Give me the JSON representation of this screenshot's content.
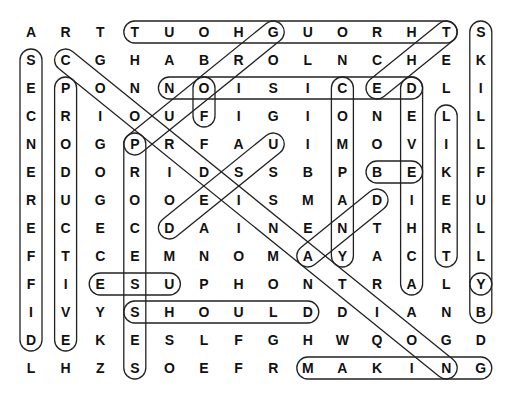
{
  "puzzle": {
    "grid_origin": {
      "x": 31,
      "y": 32
    },
    "cell_spacing": {
      "x": 34.6,
      "y": 28
    },
    "rows": [
      [
        "A",
        "R",
        "T",
        "T",
        "U",
        "O",
        "H",
        "G",
        "U",
        "O",
        "R",
        "H",
        "T",
        "S"
      ],
      [
        "S",
        "C",
        "G",
        "H",
        "A",
        "B",
        "R",
        "O",
        "L",
        "N",
        "C",
        "H",
        "E",
        "K"
      ],
      [
        "E",
        "P",
        "O",
        "N",
        "N",
        "O",
        "I",
        "S",
        "I",
        "C",
        "E",
        "D",
        "L",
        "I"
      ],
      [
        "C",
        "R",
        "I",
        "O",
        "U",
        "F",
        "I",
        "G",
        "I",
        "O",
        "N",
        "E",
        "L",
        "L"
      ],
      [
        "N",
        "O",
        "G",
        "P",
        "R",
        "F",
        "A",
        "U",
        "I",
        "M",
        "O",
        "V",
        "I",
        "L"
      ],
      [
        "E",
        "D",
        "O",
        "R",
        "I",
        "D",
        "S",
        "S",
        "B",
        "P",
        "B",
        "E",
        "K",
        "F"
      ],
      [
        "R",
        "U",
        "G",
        "O",
        "O",
        "E",
        "I",
        "S",
        "M",
        "A",
        "D",
        "I",
        "E",
        "U"
      ],
      [
        "E",
        "C",
        "E",
        "C",
        "D",
        "A",
        "I",
        "N",
        "E",
        "N",
        "T",
        "H",
        "R",
        "L"
      ],
      [
        "F",
        "T",
        "C",
        "E",
        "M",
        "N",
        "O",
        "M",
        "A",
        "Y",
        "A",
        "C",
        "T",
        "L"
      ],
      [
        "F",
        "I",
        "E",
        "S",
        "U",
        "P",
        "H",
        "O",
        "N",
        "T",
        "R",
        "A",
        "L",
        "Y"
      ],
      [
        "I",
        "V",
        "Y",
        "S",
        "H",
        "O",
        "U",
        "L",
        "D",
        "D",
        "I",
        "A",
        "N",
        "B"
      ],
      [
        "D",
        "E",
        "K",
        "E",
        "S",
        "L",
        "F",
        "G",
        "H",
        "W",
        "Q",
        "O",
        "G",
        "D"
      ],
      [
        "L",
        "H",
        "Z",
        "S",
        "O",
        "E",
        "F",
        "R",
        "M",
        "A",
        "K",
        "I",
        "N",
        "G"
      ]
    ],
    "found_words": [
      {
        "word": "THROUGHOUT",
        "start": [
          0,
          12
        ],
        "end": [
          0,
          3
        ]
      },
      {
        "word": "SKILLFULLY",
        "start": [
          0,
          13
        ],
        "end": [
          9,
          13
        ]
      },
      {
        "word": "BY",
        "start": [
          9,
          13
        ],
        "end": [
          10,
          13
        ]
      },
      {
        "word": "DIFFERENCES",
        "start": [
          11,
          0
        ],
        "end": [
          1,
          0
        ]
      },
      {
        "word": "PRODUCTIVE",
        "start": [
          2,
          1
        ],
        "end": [
          11,
          1
        ]
      },
      {
        "word": "COORDINATING",
        "start": [
          1,
          1
        ],
        "end": [
          12,
          12
        ]
      },
      {
        "word": "GROUP",
        "start": [
          0,
          7
        ],
        "end": [
          4,
          3
        ]
      },
      {
        "word": "DECISION",
        "start": [
          2,
          11
        ],
        "end": [
          2,
          4
        ]
      },
      {
        "word": "OF",
        "start": [
          2,
          5
        ],
        "end": [
          3,
          5
        ]
      },
      {
        "word": "THE",
        "start": [
          0,
          12
        ],
        "end": [
          2,
          10
        ]
      },
      {
        "word": "COMPANY",
        "start": [
          2,
          9
        ],
        "end": [
          8,
          9
        ]
      },
      {
        "word": "ACHIEVED",
        "start": [
          9,
          11
        ],
        "end": [
          2,
          11
        ]
      },
      {
        "word": "LIKERT",
        "start": [
          3,
          12
        ],
        "end": [
          8,
          12
        ]
      },
      {
        "word": "BE",
        "start": [
          5,
          10
        ],
        "end": [
          5,
          11
        ]
      },
      {
        "word": "USED",
        "start": [
          4,
          7
        ],
        "end": [
          7,
          4
        ]
      },
      {
        "word": "AND",
        "start": [
          8,
          8
        ],
        "end": [
          6,
          10
        ]
      },
      {
        "word": "PROCESSES",
        "start": [
          4,
          3
        ],
        "end": [
          12,
          3
        ]
      },
      {
        "word": "USE",
        "start": [
          9,
          4
        ],
        "end": [
          9,
          2
        ]
      },
      {
        "word": "SHOULD",
        "start": [
          10,
          3
        ],
        "end": [
          10,
          8
        ]
      },
      {
        "word": "MAKING",
        "start": [
          12,
          8
        ],
        "end": [
          12,
          13
        ]
      }
    ],
    "highlight_color": "#222222"
  }
}
